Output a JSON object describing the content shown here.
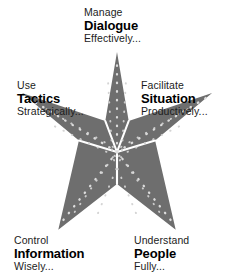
{
  "diagram": {
    "type": "five-point-star-model",
    "title": "",
    "colors": {
      "background": "#ffffff",
      "star_fill": "#6e6e6e",
      "divider_line": "#ffffff",
      "dot_color": "#d8d8d8",
      "text": "#1c1c1c",
      "text_bold": "#000000"
    },
    "geometry": {
      "center_x": 117,
      "center_y": 152,
      "outer_radius": 100,
      "inner_radius": 40,
      "tips": [
        {
          "name": "top",
          "x": 117,
          "y": 53
        },
        {
          "name": "right",
          "x": 215,
          "y": 117
        },
        {
          "name": "bottom-right",
          "x": 178,
          "y": 231
        },
        {
          "name": "bottom-left",
          "x": 56,
          "y": 231
        },
        {
          "name": "left",
          "x": 20,
          "y": 117
        }
      ]
    },
    "points": [
      {
        "id": "dialogue",
        "position": "top",
        "verb": "Manage",
        "noun": "Dialogue",
        "adverb": "Effectively..."
      },
      {
        "id": "tactics",
        "position": "left",
        "verb": "Use",
        "noun": "Tactics",
        "adverb": "Strategically..."
      },
      {
        "id": "situation",
        "position": "right",
        "verb": "Facilitate",
        "noun": "Situation",
        "adverb": "Productively..."
      },
      {
        "id": "information",
        "position": "bottom-left",
        "verb": "Control",
        "noun": "Information",
        "adverb": "Wisely..."
      },
      {
        "id": "people",
        "position": "bottom-right",
        "verb": "Understand",
        "noun": "People",
        "adverb": "Fully..."
      }
    ]
  }
}
